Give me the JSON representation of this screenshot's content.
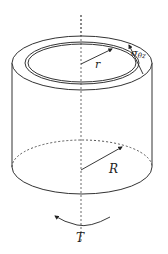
{
  "diagram": {
    "labels": {
      "inner_radius": "r",
      "outer_radius": "R",
      "torque": "T",
      "shear_stress_symbol": "σ",
      "shear_stress_subscript": "θz"
    },
    "colors": {
      "stroke": "#333333",
      "background": "#ffffff"
    },
    "elements": [
      "vertical dashed axis",
      "outer top ellipse",
      "inner double-line ellipse (thin wall)",
      "cylinder side walls",
      "bottom solid front arc",
      "bottom dashed back arc",
      "inner radius arrow r",
      "outer radius arrow R",
      "shear stress arrow σθz",
      "curved torque arrow T"
    ]
  }
}
